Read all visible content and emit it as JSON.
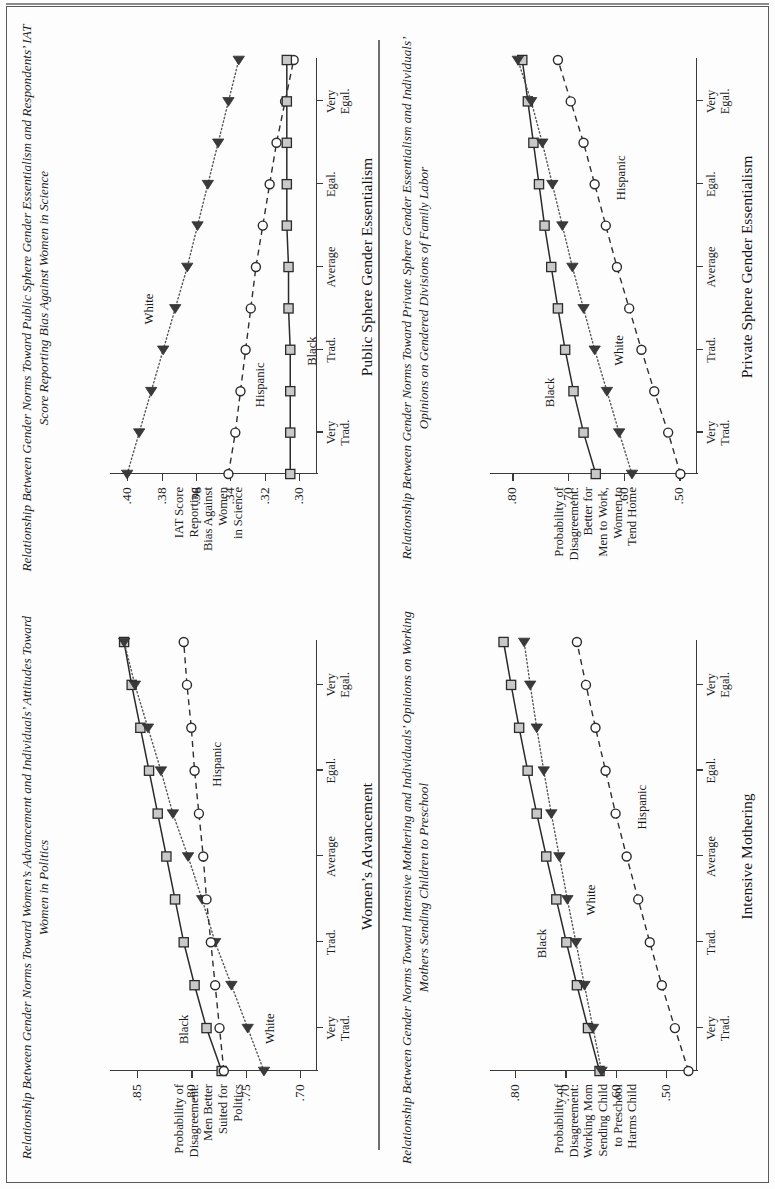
{
  "page": {
    "divider": true
  },
  "charts": [
    {
      "id": "public-sphere",
      "title": "Relationship Between Gender Norms Toward Public Sphere Gender Essentialism and Respondents’ IAT Score Reporting Bias Against Women in Science",
      "xlabel": "Public Sphere Gender Essentialism",
      "ylabel": "IAT Score\nReporting\nBias Against\nWomen\nin Science",
      "yticks": [
        ".40",
        ".38",
        ".36",
        ".34",
        ".32",
        ".30"
      ],
      "xticks": [
        "Very\nTrad.",
        "Trad.",
        "Average",
        "Egal.",
        "Very\nEgal."
      ],
      "series_labels": {
        "white": "White",
        "hispanic": "Hispanic",
        "black": "Black"
      },
      "chart_data": {
        "type": "line",
        "title": "Relationship Between Gender Norms Toward Public Sphere Gender Essentialism and Respondents’ IAT Score Reporting Bias Against Women in Science",
        "xlabel": "Public Sphere Gender Essentialism",
        "ylabel": "IAT Score Reporting Bias Against Women in Science",
        "x": [
          0,
          1,
          2,
          3,
          4,
          5,
          6,
          7,
          8,
          9,
          10
        ],
        "xtick_labels": [
          "Very Trad.",
          "Trad.",
          "Average",
          "Egal.",
          "Very Egal."
        ],
        "xtick_positions": [
          1,
          3,
          5,
          7,
          9
        ],
        "ylim": [
          0.29,
          0.41
        ],
        "yticks": [
          0.4,
          0.38,
          0.36,
          0.34,
          0.32,
          0.3
        ],
        "grid": false,
        "legend": "inline-labels",
        "series": [
          {
            "name": "White",
            "marker": "triangle",
            "linestyle": "dotted",
            "values": [
              0.4,
              0.393,
              0.386,
              0.379,
              0.372,
              0.365,
              0.359,
              0.353,
              0.347,
              0.341,
              0.335
            ]
          },
          {
            "name": "Hispanic",
            "marker": "circle",
            "linestyle": "dashed",
            "values": [
              0.341,
              0.337,
              0.334,
              0.331,
              0.328,
              0.325,
              0.321,
              0.317,
              0.313,
              0.308,
              0.303
            ]
          },
          {
            "name": "Black",
            "marker": "square",
            "linestyle": "solid",
            "values": [
              0.305,
              0.305,
              0.305,
              0.305,
              0.306,
              0.306,
              0.307,
              0.307,
              0.307,
              0.307,
              0.307
            ]
          }
        ]
      }
    },
    {
      "id": "private-sphere",
      "title": "Relationship Between Gender Norms Toward Private Sphere Gender Essentialism and Individuals’ Opinions on Gendered Divisions of Family Labor",
      "xlabel": "Private Sphere Gender Essentialism",
      "ylabel": "Probability of\nDisagreement:\nBetter for\nMen to Work,\nWomen to\nTend Home",
      "yticks": [
        ".80",
        ".70",
        ".60",
        ".50"
      ],
      "xticks": [
        "Very\nTrad.",
        "Trad.",
        "Average",
        "Egal.",
        "Very\nEgal."
      ],
      "series_labels": {
        "white": "White",
        "hispanic": "Hispanic",
        "black": "Black"
      },
      "chart_data": {
        "type": "line",
        "title": "Relationship Between Gender Norms Toward Private Sphere Gender Essentialism and Individuals’ Opinions on Gendered Divisions of Family Labor",
        "xlabel": "Private Sphere Gender Essentialism",
        "ylabel": "Probability of Disagreement: Better for Men to Work, Women to Tend Home",
        "x": [
          0,
          1,
          2,
          3,
          4,
          5,
          6,
          7,
          8,
          9,
          10
        ],
        "xtick_labels": [
          "Very Trad.",
          "Trad.",
          "Average",
          "Egal.",
          "Very Egal."
        ],
        "xtick_positions": [
          1,
          3,
          5,
          7,
          9
        ],
        "ylim": [
          0.47,
          0.84
        ],
        "yticks": [
          0.8,
          0.7,
          0.6,
          0.5
        ],
        "grid": false,
        "legend": "inline-labels",
        "series": [
          {
            "name": "Black",
            "marker": "square",
            "linestyle": "solid",
            "values": [
              0.65,
              0.672,
              0.69,
              0.705,
              0.718,
              0.73,
              0.742,
              0.752,
              0.762,
              0.772,
              0.782
            ]
          },
          {
            "name": "White",
            "marker": "triangle",
            "linestyle": "dotted",
            "values": [
              0.585,
              0.608,
              0.63,
              0.652,
              0.672,
              0.692,
              0.71,
              0.728,
              0.746,
              0.766,
              0.79
            ]
          },
          {
            "name": "Hispanic",
            "marker": "circle",
            "linestyle": "dashed",
            "values": [
              0.498,
              0.52,
              0.545,
              0.568,
              0.59,
              0.612,
              0.632,
              0.652,
              0.672,
              0.695,
              0.718
            ]
          }
        ]
      }
    },
    {
      "id": "womens-advancement",
      "title": "Relationship Between Gender Norms Toward Women’s Advancement and Individuals’ Attitudes Toward Women in Politics",
      "xlabel": "Women’s Advancement",
      "ylabel": "Probability of\nDisagreement:\nMen Better\nSuited for\nPolitics",
      "yticks": [
        ".85",
        ".80",
        ".75",
        ".70"
      ],
      "xticks": [
        "Very\nTrad.",
        "Trad.",
        "Average",
        "Egal.",
        "Very\nEgal."
      ],
      "series_labels": {
        "white": "White",
        "hispanic": "Hispanic",
        "black": "Black"
      },
      "chart_data": {
        "type": "line",
        "title": "Relationship Between Gender Norms Toward Women’s Advancement and Individuals’ Attitudes Toward Women in Politics",
        "xlabel": "Women’s Advancement",
        "ylabel": "Probability of Disagreement: Men Better Suited for Politics",
        "x": [
          0,
          1,
          2,
          3,
          4,
          5,
          6,
          7,
          8,
          9,
          10
        ],
        "xtick_labels": [
          "Very Trad.",
          "Trad.",
          "Average",
          "Egal.",
          "Very Egal."
        ],
        "xtick_positions": [
          1,
          3,
          5,
          7,
          9
        ],
        "ylim": [
          0.685,
          0.875
        ],
        "yticks": [
          0.85,
          0.8,
          0.75,
          0.7
        ],
        "grid": false,
        "legend": "inline-labels",
        "series": [
          {
            "name": "Black",
            "marker": "square",
            "linestyle": "solid",
            "values": [
              0.772,
              0.786,
              0.797,
              0.807,
              0.815,
              0.823,
              0.831,
              0.839,
              0.847,
              0.855,
              0.862
            ]
          },
          {
            "name": "White",
            "marker": "triangle",
            "linestyle": "dotted",
            "values": [
              0.733,
              0.748,
              0.763,
              0.778,
              0.79,
              0.803,
              0.817,
              0.828,
              0.84,
              0.852,
              0.862
            ]
          },
          {
            "name": "Hispanic",
            "marker": "circle",
            "linestyle": "dashed",
            "values": [
              0.77,
              0.774,
              0.778,
              0.782,
              0.786,
              0.789,
              0.793,
              0.797,
              0.8,
              0.804,
              0.807
            ]
          }
        ]
      }
    },
    {
      "id": "intensive-mothering",
      "title": "Relationship Between Gender Norms Toward Intensive Mothering and Individuals’ Opinions on Working Mothers Sending Children to Preschool",
      "xlabel": "Intensive Mothering",
      "ylabel": "Probability of\nDisagreement:\nWorking Mom\nSending Child\nto Preschool\nHarms Child",
      "yticks": [
        ".80",
        ".70",
        ".60",
        ".50"
      ],
      "xticks": [
        "Very\nTrad.",
        "Trad.",
        "Average",
        "Egal.",
        "Very\nEgal."
      ],
      "series_labels": {
        "white": "White",
        "hispanic": "Hispanic",
        "black": "Black"
      },
      "chart_data": {
        "type": "line",
        "title": "Relationship Between Gender Norms Toward Intensive Mothering and Individuals’ Opinions on Working Mothers Sending Children to Preschool",
        "xlabel": "Intensive Mothering",
        "ylabel": "Probability of Disagreement: Working Mom Sending Child to Preschool Harms Child",
        "x": [
          0,
          1,
          2,
          3,
          4,
          5,
          6,
          7,
          8,
          9,
          10
        ],
        "xtick_labels": [
          "Very Trad.",
          "Trad.",
          "Average",
          "Egal.",
          "Very Egal."
        ],
        "xtick_positions": [
          1,
          3,
          5,
          7,
          9
        ],
        "ylim": [
          0.44,
          0.85
        ],
        "yticks": [
          0.8,
          0.7,
          0.6,
          0.5
        ],
        "grid": false,
        "legend": "inline-labels",
        "series": [
          {
            "name": "Black",
            "marker": "square",
            "linestyle": "solid",
            "values": [
              0.632,
              0.655,
              0.677,
              0.698,
              0.718,
              0.738,
              0.757,
              0.775,
              0.792,
              0.808,
              0.823
            ]
          },
          {
            "name": "White",
            "marker": "triangle",
            "linestyle": "dotted",
            "values": [
              0.628,
              0.645,
              0.662,
              0.679,
              0.696,
              0.712,
              0.728,
              0.743,
              0.757,
              0.77,
              0.782
            ]
          },
          {
            "name": "Hispanic",
            "marker": "circle",
            "linestyle": "dashed",
            "values": [
              0.455,
              0.482,
              0.508,
              0.532,
              0.555,
              0.578,
              0.6,
              0.62,
              0.64,
              0.659,
              0.677
            ]
          }
        ]
      }
    }
  ]
}
